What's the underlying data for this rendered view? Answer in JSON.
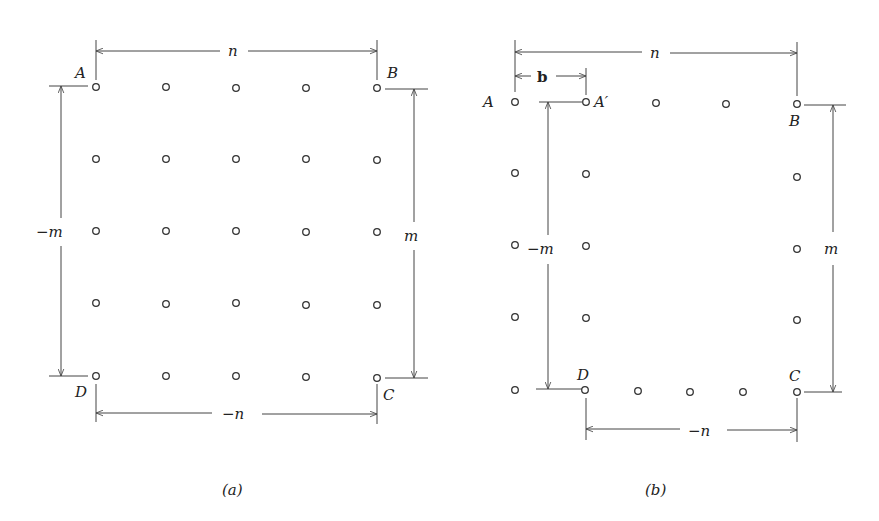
{
  "figure_a": {
    "caption": "(a)",
    "corner_labels": {
      "A": "A",
      "B": "B",
      "C": "C",
      "D": "D"
    },
    "dimensions": {
      "top": "n",
      "bottom": "−n",
      "left": "−m",
      "right": "m"
    },
    "grid": {
      "rows": 5,
      "cols": 5
    }
  },
  "figure_b": {
    "caption": "(b)",
    "corner_labels": {
      "A": "A",
      "A_prime": "A′",
      "B": "B",
      "C": "C",
      "D": "D"
    },
    "dimensions": {
      "top": "n",
      "offset": "b",
      "bottom": "−n",
      "left": "−m",
      "right": "m"
    }
  },
  "colors": {
    "ink": "#333333",
    "background": "#ffffff"
  }
}
